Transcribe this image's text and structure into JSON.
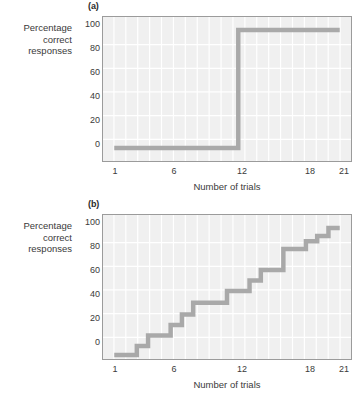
{
  "figure": {
    "background": "#ffffff",
    "line_color": "#a9a9a9",
    "plot_background": "#f0f0f0",
    "gridline_color": "#ffffff",
    "axis_color": "#9b9b9b"
  },
  "panels": [
    {
      "label": "(a)",
      "ylabel_lines": [
        "Percentage",
        "correct",
        "responses"
      ],
      "xlabel": "Number of trials",
      "yticks": [
        "100",
        "80",
        "60",
        "40",
        "20",
        "0"
      ],
      "xticks": [
        "1",
        "6",
        "12",
        "18",
        "21"
      ]
    },
    {
      "label": "(b)",
      "ylabel_lines": [
        "Percentage",
        "correct",
        "responses"
      ],
      "xlabel": "Number of trials",
      "yticks": [
        "100",
        "80",
        "60",
        "40",
        "20",
        "0"
      ],
      "xticks": [
        "1",
        "6",
        "12",
        "18",
        "21"
      ]
    }
  ],
  "chart_data": [
    {
      "type": "line",
      "title": "(a)",
      "subtitle": "",
      "xlabel": "Number of trials",
      "ylabel": "Percentage correct responses",
      "xlim": [
        0,
        22
      ],
      "ylim": [
        0,
        110
      ],
      "xticks": [
        1,
        6,
        12,
        18,
        21
      ],
      "yticks": [
        0,
        20,
        40,
        60,
        80,
        100
      ],
      "grid": true,
      "legend": "none",
      "series": [
        {
          "name": "all-or-none learning",
          "color": "#a9a9a9",
          "x": [
            1,
            2,
            3,
            4,
            5,
            6,
            7,
            8,
            9,
            10,
            11,
            12,
            13,
            14,
            15,
            16,
            17,
            18,
            19,
            20,
            21
          ],
          "values": [
            10,
            10,
            10,
            10,
            10,
            10,
            10,
            10,
            10,
            10,
            10,
            100,
            100,
            100,
            100,
            100,
            100,
            100,
            100,
            100,
            100
          ]
        }
      ]
    },
    {
      "type": "line",
      "title": "(b)",
      "subtitle": "",
      "xlabel": "Number of trials",
      "ylabel": "Percentage correct responses",
      "xlim": [
        0,
        22
      ],
      "ylim": [
        0,
        110
      ],
      "xticks": [
        1,
        6,
        12,
        18,
        21
      ],
      "yticks": [
        0,
        20,
        40,
        60,
        80,
        100
      ],
      "grid": true,
      "legend": "none",
      "series": [
        {
          "name": "incremental learning",
          "color": "#a9a9a9",
          "x": [
            1,
            2,
            3,
            4,
            5,
            6,
            7,
            8,
            9,
            10,
            11,
            12,
            13,
            14,
            15,
            16,
            17,
            18,
            19,
            20,
            21
          ],
          "values": [
            3,
            3,
            10,
            18,
            18,
            26,
            34,
            43,
            43,
            43,
            52,
            52,
            60,
            68,
            68,
            84,
            84,
            90,
            94,
            100,
            100
          ]
        }
      ]
    }
  ]
}
